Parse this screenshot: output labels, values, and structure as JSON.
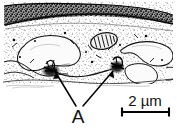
{
  "figure": {
    "type": "electron-micrograph",
    "modality": "transmission electron microscopy",
    "rendering": "halftone line drawing, black and white",
    "width_px": 177,
    "height_px": 129,
    "background_color": "#ffffff",
    "ink_color": "#1a1a1a"
  },
  "annotations": {
    "structure_label": "A",
    "structure_label_meaning": "adherens / desmosome-like cell junction",
    "leader_lines": [
      {
        "name": "leader-line-left",
        "from_x": 76,
        "from_y": 106,
        "to_x": 56,
        "to_y": 73,
        "points_to": "left dark junction"
      },
      {
        "name": "leader-line-right",
        "from_x": 83,
        "from_y": 106,
        "to_x": 113,
        "to_y": 71,
        "points_to": "right dark junction"
      }
    ]
  },
  "scale_bar": {
    "label": "2 µm",
    "value": 2,
    "unit": "µm",
    "bar_x_start": 121,
    "bar_x_end": 170,
    "bar_y": 112,
    "cap_height": 9,
    "style": "I-beam with end caps"
  },
  "features": {
    "top_band": {
      "name": "dark-apical-band",
      "description": "dense elongated dark band spanning the top of the field"
    },
    "mitochondrion": {
      "name": "mitochondrion",
      "description": "oval organelle with internal cristae striations",
      "cx": 104,
      "cy": 41,
      "rx": 13,
      "ry": 8
    },
    "junctions": [
      {
        "name": "junction-left",
        "cx": 51,
        "cy": 71
      },
      {
        "name": "junction-right",
        "cx": 117,
        "cy": 67
      }
    ],
    "cell_profiles": [
      {
        "name": "cell-profile-left",
        "description": "large irregular pale cell body, left of center"
      },
      {
        "name": "cell-profile-right-upper",
        "description": "hook-shaped pale cell profile, upper right"
      },
      {
        "name": "cell-profile-right-lower",
        "description": "rounded pale cell profile, lower right"
      }
    ],
    "cytoplasm": {
      "name": "cytoplasm-stipple",
      "description": "fine granular stipple texture filling the field"
    },
    "baseline": {
      "name": "basal-boundary-line",
      "y": 83,
      "description": "irregular horizontal boundary below which the field is blank white"
    }
  }
}
